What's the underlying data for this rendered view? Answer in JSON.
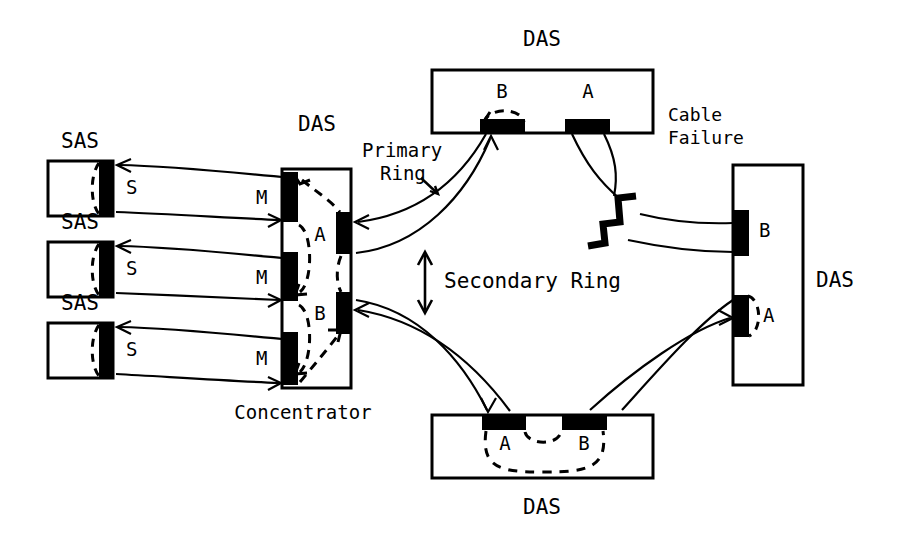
{
  "diagram": {
    "stroke_color": "#000000",
    "port_fill_color": "#000000",
    "background_color": "#ffffff"
  },
  "labels": {
    "top_das": "DAS",
    "right_das": "DAS",
    "bottom_das": "DAS",
    "concentrator_das": "DAS",
    "concentrator_name": "Concentrator",
    "sas_1": "SAS",
    "sas_2": "SAS",
    "sas_3": "SAS",
    "primary_ring": "Primary\nRing",
    "primary_ring_line1": "Primary",
    "primary_ring_line2": "Ring",
    "secondary_ring": "Secondary Ring",
    "cable_failure_line1": "Cable",
    "cable_failure_line2": "Failure"
  },
  "ports": {
    "top_das_b": "B",
    "top_das_a": "A",
    "right_das_b": "B",
    "right_das_a": "A",
    "bottom_das_a": "A",
    "bottom_das_b": "B",
    "concentrator_a": "A",
    "concentrator_b": "B",
    "concentrator_m1": "M",
    "concentrator_m2": "M",
    "concentrator_m3": "M",
    "sas_1_s": "S",
    "sas_2_s": "S",
    "sas_3_s": "S"
  }
}
